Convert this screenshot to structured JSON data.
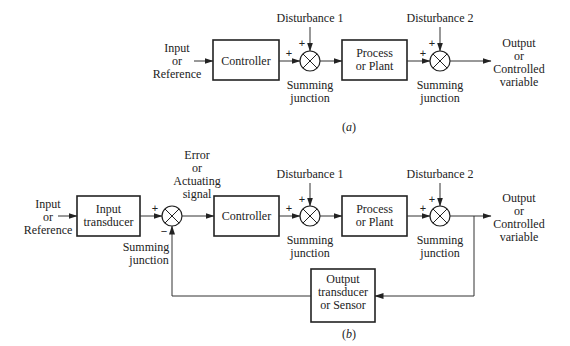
{
  "diagram_a": {
    "input_label": [
      "Input",
      "or",
      "Reference"
    ],
    "controller": "Controller",
    "disturbance1": "Disturbance 1",
    "disturbance2": "Disturbance 2",
    "process": [
      "Process",
      "or Plant"
    ],
    "summing1": [
      "Summing",
      "junction"
    ],
    "summing2": [
      "Summing",
      "junction"
    ],
    "output_label": [
      "Output",
      "or",
      "Controlled",
      "variable"
    ],
    "plus": "+",
    "caption_open": "(",
    "caption_letter": "a",
    "caption_close": ")"
  },
  "diagram_b": {
    "input_label": [
      "Input",
      "or",
      "Reference"
    ],
    "input_transducer": [
      "Input",
      "transducer"
    ],
    "error_label": [
      "Error",
      "or",
      "Actuating",
      "signal"
    ],
    "summing0": [
      "Summing",
      "junction"
    ],
    "controller": "Controller",
    "disturbance1": "Disturbance 1",
    "disturbance2": "Disturbance 2",
    "process": [
      "Process",
      "or Plant"
    ],
    "summing1": [
      "Summing",
      "junction"
    ],
    "summing2": [
      "Summing",
      "junction"
    ],
    "output_label": [
      "Output",
      "or",
      "Controlled",
      "variable"
    ],
    "sensor": [
      "Output",
      "transducer",
      "or Sensor"
    ],
    "plus": "+",
    "minus": "−",
    "caption_open": "(",
    "caption_letter": "b",
    "caption_close": ")"
  }
}
